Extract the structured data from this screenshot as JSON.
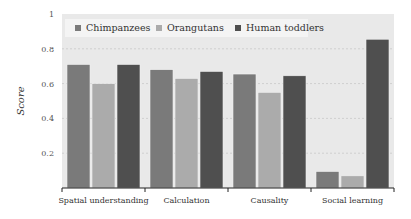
{
  "chart_data": {
    "type": "bar",
    "title": "",
    "xlabel": "",
    "ylabel": "Score",
    "ylim": [
      0,
      1
    ],
    "yticks": [
      0.2,
      0.4,
      0.6,
      0.8,
      1
    ],
    "ytick_labels": [
      "0.2",
      "0.4",
      "0.6",
      "0.8",
      "1"
    ],
    "grid": true,
    "legend_position": "top-left inside",
    "categories": [
      "Spatial understanding",
      "Calculation",
      "Causality",
      "Social learning"
    ],
    "series": [
      {
        "name": "Chimpanzees",
        "color": "#7a7a7a",
        "values": [
          0.71,
          0.68,
          0.655,
          0.095
        ]
      },
      {
        "name": "Orangutans",
        "color": "#ababab",
        "values": [
          0.6,
          0.63,
          0.55,
          0.07
        ]
      },
      {
        "name": "Human toddlers",
        "color": "#4f4f4f",
        "values": [
          0.71,
          0.67,
          0.645,
          0.855
        ]
      }
    ]
  },
  "colors": {
    "plot_background": "#e9e9e9",
    "legend_background": "#f4f4f4",
    "axis": "#222222",
    "grid": "#cfcfcf"
  }
}
